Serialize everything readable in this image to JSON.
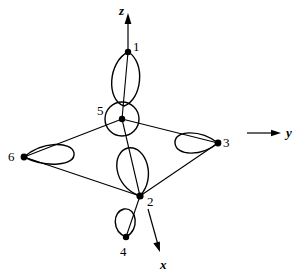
{
  "figure": {
    "type": "graph-diagram",
    "background_color": "#ffffff",
    "stroke_color": "#000000",
    "axes": [
      {
        "id": "z",
        "label": "z",
        "direction": "up",
        "label_x": 119,
        "label_y": 4
      },
      {
        "id": "y",
        "label": "y",
        "direction": "right",
        "label_x": 286,
        "label_y": 126
      },
      {
        "id": "x",
        "label": "x",
        "direction": "down-right",
        "label_x": 160,
        "label_y": 258
      }
    ],
    "nodes": [
      {
        "id": "1",
        "label": "1",
        "x": 128,
        "y": 52,
        "label_x": 133,
        "label_y": 40,
        "loop": "vertical-ellipse-down"
      },
      {
        "id": "5",
        "label": "5",
        "x": 122,
        "y": 119,
        "label_x": 97,
        "label_y": 104,
        "loop": "circle-around"
      },
      {
        "id": "3",
        "label": "3",
        "x": 218,
        "y": 143,
        "label_x": 223,
        "label_y": 136,
        "loop": "teardrop-left"
      },
      {
        "id": "6",
        "label": "6",
        "x": 24,
        "y": 157,
        "label_x": 8,
        "label_y": 150,
        "loop": "teardrop-right"
      },
      {
        "id": "2",
        "label": "2",
        "x": 140,
        "y": 196,
        "label_x": 147,
        "label_y": 195,
        "loop": "teardrop-up"
      },
      {
        "id": "4",
        "label": "4",
        "x": 126,
        "y": 237,
        "label_x": 120,
        "label_y": 245,
        "loop": "teardrop-up"
      }
    ],
    "edges": [
      {
        "from": "5",
        "to": "6"
      },
      {
        "from": "5",
        "to": "3"
      },
      {
        "from": "6",
        "to": "2"
      },
      {
        "from": "3",
        "to": "2"
      },
      {
        "from": "1",
        "to": "5"
      },
      {
        "from": "5",
        "to": "2"
      },
      {
        "from": "2",
        "to": "4"
      }
    ]
  }
}
